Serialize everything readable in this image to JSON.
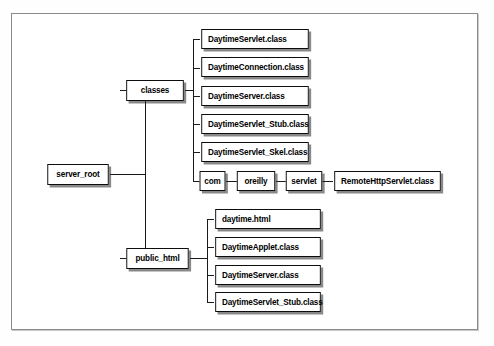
{
  "diagram": {
    "type": "tree",
    "root": "server_root",
    "colors": {
      "box_border": "#0d0d0d",
      "box_fill": "#ffffff",
      "line": "#1a1a1a",
      "frame_border": "#8a8a8a",
      "page_background": "#ffffff",
      "shadow": "#282828"
    },
    "nodes": {
      "root": {
        "label": "server_root"
      },
      "classes": {
        "label": "classes"
      },
      "public_html": {
        "label": "public_html"
      },
      "com": {
        "label": "com"
      },
      "oreilly": {
        "label": "oreilly"
      },
      "servlet": {
        "label": "servlet"
      },
      "remote_http_servlet": {
        "label": "RemoteHttpServlet.class"
      }
    },
    "classes_children": [
      {
        "label": "DaytimeServlet.class"
      },
      {
        "label": "DaytimeConnection.class"
      },
      {
        "label": "DaytimeServer.class"
      },
      {
        "label": "DaytimeServlet_Stub.class"
      },
      {
        "label": "DaytimeServlet_Skel.class"
      }
    ],
    "public_html_children": [
      {
        "label": "daytime.html"
      },
      {
        "label": "DaytimeApplet.class"
      },
      {
        "label": "DaytimeServer.class"
      },
      {
        "label": "DaytimeServlet_Stub.class"
      }
    ]
  }
}
